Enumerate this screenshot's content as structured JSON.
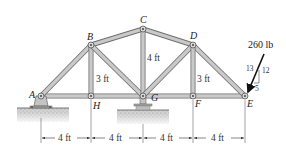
{
  "diagram": {
    "type": "truss",
    "nodes": {
      "A": {
        "label": "A",
        "x": 41,
        "y": 96
      },
      "H": {
        "label": "H",
        "x": 91,
        "y": 96
      },
      "G": {
        "label": "G",
        "x": 143,
        "y": 96
      },
      "F": {
        "label": "F",
        "x": 193,
        "y": 96
      },
      "E": {
        "label": "E",
        "x": 245,
        "y": 96
      },
      "B": {
        "label": "B",
        "x": 91,
        "y": 45
      },
      "C": {
        "label": "C",
        "x": 143,
        "y": 29
      },
      "D": {
        "label": "D",
        "x": 193,
        "y": 45
      }
    },
    "members": [
      [
        "A",
        "H"
      ],
      [
        "H",
        "G"
      ],
      [
        "G",
        "F"
      ],
      [
        "F",
        "E"
      ],
      [
        "A",
        "B"
      ],
      [
        "B",
        "C"
      ],
      [
        "C",
        "D"
      ],
      [
        "D",
        "E"
      ],
      [
        "B",
        "H"
      ],
      [
        "B",
        "G"
      ],
      [
        "C",
        "G"
      ],
      [
        "D",
        "G"
      ],
      [
        "D",
        "F"
      ]
    ],
    "height_labels": {
      "bh": "3 ft",
      "cg": "4 ft",
      "df": "3 ft"
    },
    "span_labels": [
      "4 ft",
      "4 ft",
      "4 ft",
      "4 ft"
    ],
    "load": {
      "magnitude": "260 lb",
      "slope_hyp": "13",
      "slope_vert": "12",
      "slope_horiz": "5",
      "at_node": "E"
    },
    "supports": {
      "A": "pin",
      "G": "roller"
    },
    "colors": {
      "member": "#c9c9c9",
      "member_edge": "#6e6e6e",
      "ground": "#b8b8b8",
      "arrow": "#111111"
    }
  }
}
